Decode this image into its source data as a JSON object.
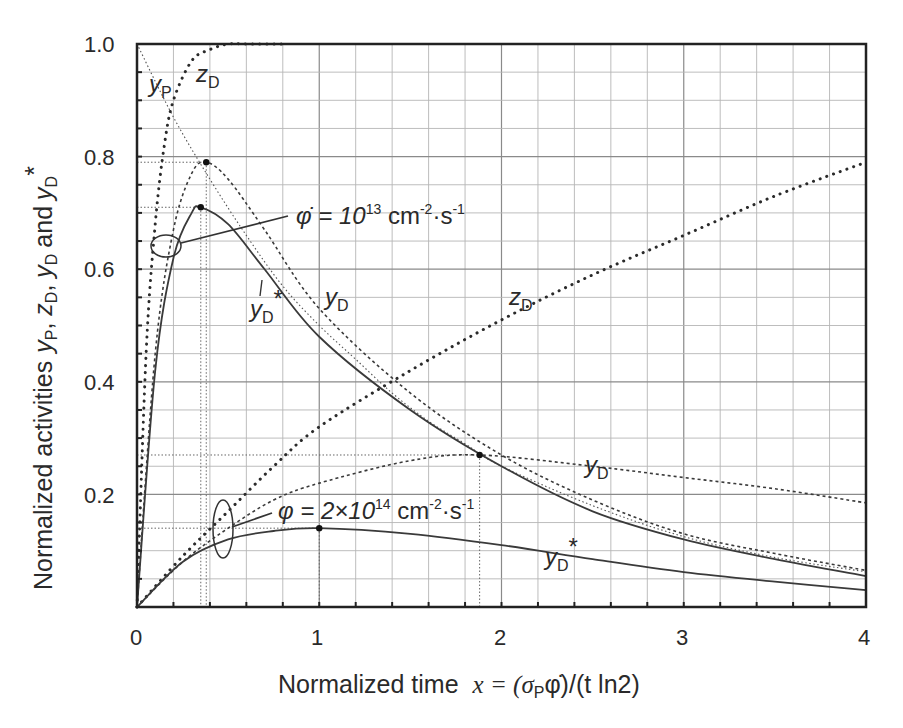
{
  "chart_data": {
    "type": "line",
    "title": "",
    "xlabel": "Normalized time  x = (σPφ̇)/(t ln2)",
    "xlabel_parts": {
      "text": "Normalized time",
      "formula": "x = (σ",
      "sub": "P",
      "formula_rest": "φ̇)/(t ln2)"
    },
    "ylabel": "Normalized activities yP, zD, yD and yD*",
    "ylabel_parts": {
      "text": "Normalized activities",
      "y1": "y",
      "s1": "P",
      "y2": "z",
      "s2": "D",
      "y3": "y",
      "s3": "D",
      "and": "and",
      "y4": "y",
      "s4": "D",
      "star": "*"
    },
    "xlim": [
      0,
      4
    ],
    "ylim": [
      0,
      1.0
    ],
    "x_ticks": [
      "0",
      "1",
      "2",
      "3",
      "4"
    ],
    "y_ticks": [
      "0.2",
      "0.4",
      "0.6",
      "0.8",
      "1.0"
    ],
    "grid": true,
    "legend": "none (inline annotations)",
    "annotations": [
      {
        "text": "φ̇ = 10^13 cm^-2·s^-1",
        "base": "φ̇ = 10",
        "exp": "13",
        "unit": " cm",
        "unit_exp": "-2",
        "dot": "·s",
        "s_exp": "-1"
      },
      {
        "text": "φ = 2×10^14 cm^-2·s^-1",
        "base": "φ = 2×10",
        "exp": "14",
        "unit": " cm",
        "unit_exp": "-2",
        "dot": "·s",
        "s_exp": "-1"
      }
    ],
    "curve_labels": {
      "yP": {
        "main": "y",
        "sub": "P"
      },
      "zD_top": {
        "main": "z",
        "sub": "D"
      },
      "zD_low": {
        "main": "z",
        "sub": "D"
      },
      "yD_high": {
        "main": "y",
        "sub": "D"
      },
      "yDstar_high": {
        "main": "y",
        "sub": "D",
        "star": "*"
      },
      "yD_low": {
        "main": "y",
        "sub": "D"
      },
      "yDstar_low": {
        "main": "y",
        "sub": "D",
        "star": "*"
      }
    },
    "series": [
      {
        "name": "yP (parent)",
        "style": "fine dotted",
        "x": [
          0,
          0.2,
          0.4,
          0.6,
          0.8,
          1.0,
          1.2,
          1.4,
          1.6,
          1.8,
          2.0,
          2.5,
          3.0,
          3.5,
          4.0
        ],
        "values": [
          1.0,
          0.87,
          0.76,
          0.66,
          0.57,
          0.5,
          0.44,
          0.38,
          0.33,
          0.29,
          0.25,
          0.18,
          0.125,
          0.088,
          0.0625
        ]
      },
      {
        "name": "zD (φ̇=10^13)",
        "style": "heavy dotted",
        "x": [
          0,
          0.05,
          0.1,
          0.15,
          0.2,
          0.3,
          0.4,
          0.5,
          0.6,
          0.8
        ],
        "values": [
          0,
          0.45,
          0.68,
          0.82,
          0.9,
          0.97,
          0.99,
          1.0,
          1.0,
          1.0
        ]
      },
      {
        "name": "yD (φ̇=10^13)",
        "style": "dashed",
        "x": [
          0,
          0.1,
          0.2,
          0.3,
          0.38,
          0.5,
          0.7,
          1.0,
          1.5,
          2.0,
          2.5,
          3.0,
          3.5,
          4.0
        ],
        "values": [
          0,
          0.45,
          0.67,
          0.77,
          0.79,
          0.76,
          0.67,
          0.53,
          0.38,
          0.27,
          0.19,
          0.13,
          0.095,
          0.065
        ]
      },
      {
        "name": "yD* (φ̇=10^13)",
        "style": "solid",
        "x": [
          0,
          0.1,
          0.2,
          0.3,
          0.35,
          0.5,
          0.7,
          1.0,
          1.5,
          2.0,
          2.5,
          3.0,
          3.5,
          4.0
        ],
        "values": [
          0,
          0.42,
          0.62,
          0.7,
          0.71,
          0.68,
          0.6,
          0.48,
          0.35,
          0.25,
          0.17,
          0.12,
          0.085,
          0.055
        ]
      },
      {
        "name": "zD (φ=2×10^14)",
        "style": "heavy dotted",
        "x": [
          0,
          0.25,
          0.5,
          0.75,
          1.0,
          1.5,
          2.0,
          2.5,
          3.0,
          3.5,
          4.0
        ],
        "values": [
          0,
          0.09,
          0.17,
          0.25,
          0.32,
          0.42,
          0.51,
          0.59,
          0.66,
          0.73,
          0.79
        ]
      },
      {
        "name": "yD (φ=2×10^14)",
        "style": "dashed",
        "x": [
          0,
          0.25,
          0.5,
          0.75,
          1.0,
          1.5,
          1.88,
          2.5,
          3.0,
          3.5,
          4.0
        ],
        "values": [
          0,
          0.08,
          0.14,
          0.19,
          0.22,
          0.26,
          0.27,
          0.25,
          0.23,
          0.21,
          0.185
        ]
      },
      {
        "name": "yD* (φ=2×10^14)",
        "style": "solid",
        "x": [
          0,
          0.25,
          0.5,
          0.75,
          1.0,
          1.5,
          2.0,
          2.5,
          3.0,
          3.5,
          4.0
        ],
        "values": [
          0,
          0.08,
          0.12,
          0.135,
          0.14,
          0.13,
          0.11,
          0.085,
          0.062,
          0.045,
          0.03
        ]
      }
    ],
    "marked_points": [
      {
        "series": "yD (φ̇=10^13)",
        "x": 0.38,
        "y": 0.79
      },
      {
        "series": "yD* (φ̇=10^13)",
        "x": 0.35,
        "y": 0.71
      },
      {
        "series": "yD (φ=2×10^14)",
        "x": 1.88,
        "y": 0.27
      },
      {
        "series": "yD* (φ=2×10^14)",
        "x": 1.0,
        "y": 0.14
      }
    ]
  }
}
